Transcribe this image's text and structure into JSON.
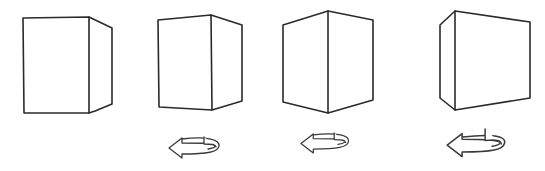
{
  "figure": {
    "colors": {
      "background": "#ffffff",
      "stroke": "#2a2a2a"
    },
    "cubes": [
      {
        "id": "cube-1",
        "polylines": [
          "23,18 89,17 89,113 24,113 23,18",
          "89,17 112,28 112,104 95,111 89,113"
        ]
      },
      {
        "id": "cube-2",
        "polylines": [
          "158,20 211,15 212,110 159,107 158,20",
          "211,15 242,25 242,101 212,110"
        ]
      },
      {
        "id": "cube-3",
        "polylines": [
          "283,25 328,11 373,20 373,100 328,113 283,102 283,25",
          "328,11 328,113"
        ]
      },
      {
        "id": "cube-4",
        "polylines": [
          "455,11 530,22 530,98 455,110 440,98 440,25 455,11",
          "455,11 455,110"
        ]
      }
    ],
    "arrows": [
      {
        "id": "arrow-1",
        "direction": "left",
        "x": 168,
        "y": 136,
        "scale": 1.0
      },
      {
        "id": "arrow-2",
        "direction": "left",
        "x": 300,
        "y": 132,
        "scale": 0.95
      },
      {
        "id": "arrow-3",
        "direction": "left",
        "x": 446,
        "y": 129,
        "scale": 1.15
      }
    ]
  }
}
